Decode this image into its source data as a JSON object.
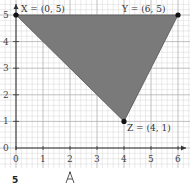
{
  "diagram": {
    "type": "coordinate-grid-triangle",
    "axes": {
      "x_ticks": [
        "0",
        "1",
        "2",
        "3",
        "4",
        "5",
        "6"
      ],
      "y_ticks": [
        "0",
        "1",
        "2",
        "3",
        "4",
        "5"
      ]
    },
    "points": [
      {
        "name": "X",
        "label": "X = (0, 5)",
        "x": 0,
        "y": 5
      },
      {
        "name": "Y",
        "label": "Y = (6, 5)",
        "x": 6,
        "y": 5
      },
      {
        "name": "Z",
        "label": "Z = (4, 1)",
        "x": 4,
        "y": 1
      }
    ],
    "colors": {
      "fill": "#7a7a7a",
      "grid_minor": "#d6d6d6",
      "grid_major": "#b0b0b0",
      "axis": "#333333"
    }
  },
  "footer": {
    "left_label": "5",
    "icon": "compass-icon"
  }
}
